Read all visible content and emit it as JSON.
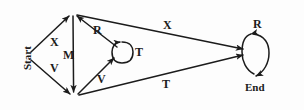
{
  "figure": {
    "kind": "state-transition-diagram",
    "background_color": "#fdfdfd",
    "stroke_color": "#1b1b1b",
    "text_color": "#1b1b1b"
  },
  "nodes": [
    {
      "id": "start",
      "label": "Start",
      "x": 30,
      "y": 56,
      "rotated": true
    },
    {
      "id": "top",
      "label": "",
      "x": 73,
      "y": 13,
      "rotated": false
    },
    {
      "id": "bottom",
      "label": "",
      "x": 74,
      "y": 97,
      "rotated": false
    },
    {
      "id": "middle",
      "label": "",
      "x": 122,
      "y": 52,
      "rotated": false
    },
    {
      "id": "end",
      "label": "End",
      "x": 249,
      "y": 52,
      "rotated": false
    }
  ],
  "edges": [
    {
      "id": "start-top",
      "label": "X",
      "from": "start",
      "to": "top",
      "label_x": 53,
      "label_y": 42
    },
    {
      "id": "start-bottom",
      "label": "V",
      "from": "start",
      "to": "bottom",
      "label_x": 53,
      "label_y": 68
    },
    {
      "id": "top-bottom",
      "label": "M",
      "from": "top",
      "to": "bottom",
      "label_x": 70,
      "label_y": 56
    },
    {
      "id": "middle-top",
      "label": "R",
      "from": "middle",
      "to": "top",
      "label_x": 97,
      "label_y": 31
    },
    {
      "id": "bottom-middle",
      "label": "V",
      "from": "bottom",
      "to": "middle",
      "label_x": 101,
      "label_y": 80
    },
    {
      "id": "middle-self",
      "label": "T",
      "from": "middle",
      "to": "middle",
      "label_x": 137,
      "label_y": 53
    },
    {
      "id": "top-end",
      "label": "X",
      "from": "top",
      "to": "end",
      "label_x": 167,
      "label_y": 26
    },
    {
      "id": "bottom-end",
      "label": "T",
      "from": "bottom",
      "to": "end",
      "label_x": 165,
      "label_y": 85
    },
    {
      "id": "end-self",
      "label": "R",
      "from": "end",
      "to": "end",
      "label_x": 257,
      "label_y": 25
    }
  ],
  "labels": {
    "start": "Start",
    "end": "End",
    "edge_x_upper_left": "X",
    "edge_v_lower_left": "V",
    "edge_m_vertical": "M",
    "edge_r_diagonal": "R",
    "edge_v_lower_mid": "V",
    "edge_t_self_middle": "T",
    "edge_x_upper_right": "X",
    "edge_t_lower_right": "T",
    "edge_r_self_end": "R"
  }
}
